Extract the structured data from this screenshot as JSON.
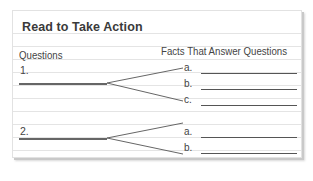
{
  "organizer": {
    "title": "Read to Take Action",
    "columns": {
      "left": "Questions",
      "right": "Facts That Answer Questions"
    },
    "questions": [
      {
        "number": "1.",
        "answers": [
          "a.",
          "b.",
          "c."
        ]
      },
      {
        "number": "2.",
        "answers": [
          "a.",
          "b."
        ]
      }
    ]
  },
  "colors": {
    "rule_line": "#e4e4e4",
    "write_line": "#555555",
    "text": "#444444",
    "shadow": "#c9c9c9"
  }
}
